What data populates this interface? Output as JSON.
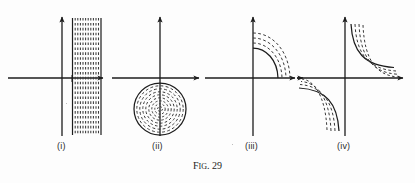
{
  "figure": {
    "caption_prefix": "F",
    "caption_small": "IG",
    "caption_suffix": ". 29",
    "caption_full": "Fig. 29",
    "background_color": "#fdfdfd",
    "ink_color": "#1c1c1c",
    "dash_color": "#3a3a3a",
    "width": 415,
    "height": 183
  },
  "panels": [
    {
      "id": "i",
      "label": "(i)",
      "label_x": 57,
      "label_y": 141,
      "description": "vertical-dashed-band",
      "axes": {
        "origin_x": 62,
        "baseline_y": 78,
        "x_axis_start": 8,
        "x_axis_end": 107,
        "y_axis_top": 14,
        "y_axis_bottom": 136
      },
      "curves": {
        "type": "vertical-lines",
        "band_left": 72,
        "band_right": 101,
        "band_top": 18,
        "band_bottom": 135,
        "line_count": 12,
        "solid_edges": true
      }
    },
    {
      "id": "ii",
      "label": "(ii)",
      "label_x": 152,
      "label_y": 141,
      "description": "concentric-circles",
      "axes": {
        "origin_x": 160,
        "baseline_y": 78,
        "x_axis_start": 112,
        "x_axis_end": 203,
        "y_axis_top": 14,
        "y_axis_bottom": 136
      },
      "curves": {
        "type": "concentric-circles",
        "center_x": 160,
        "center_y": 109,
        "outer_radius": 26,
        "ring_count": 8,
        "outer_solid": true
      }
    },
    {
      "id": "iii",
      "label": "(iii)",
      "label_x": 245,
      "label_y": 141,
      "description": "quarter-arc-family-first-quadrant",
      "axes": {
        "origin_x": 253,
        "baseline_y": 78,
        "x_axis_start": 205,
        "x_axis_end": 299,
        "y_axis_top": 14,
        "y_axis_bottom": 136
      },
      "curves": {
        "type": "arc-family",
        "solid_count": 1,
        "dashed_count": 3,
        "inner_x_intercept": 278,
        "inner_y_intercept": 48
      }
    },
    {
      "id": "iv",
      "label": "(iv)",
      "label_x": 337,
      "label_y": 141,
      "description": "hyperbola-branches",
      "axes": {
        "origin_x": 345,
        "baseline_y": 78,
        "x_axis_start": 297,
        "x_axis_end": 407,
        "y_axis_top": 14,
        "y_axis_bottom": 136
      },
      "curves": {
        "type": "hyperbola-family",
        "branches": [
          "quadrant-I",
          "quadrant-III"
        ],
        "solid_count": 1,
        "dashed_count": 3
      }
    }
  ]
}
